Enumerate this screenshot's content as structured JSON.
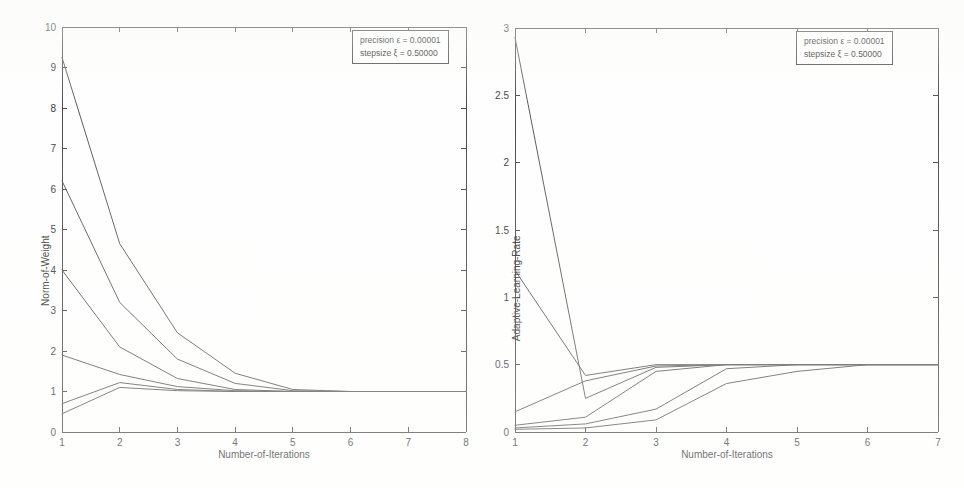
{
  "figure": {
    "background_color": "#fefefe",
    "line_color": "#5a5a5a",
    "axis_color": "#4b4b4b"
  },
  "panels": [
    {
      "id": "left",
      "legend": {
        "line1": "precision ε = 0.00001",
        "line2": "stepsize ξ = 0.50000"
      }
    },
    {
      "id": "right",
      "legend": {
        "line1": "precision ε = 0.00001",
        "line2": "stepsize ξ = 0.50000"
      }
    }
  ],
  "chart_data": [
    {
      "type": "line",
      "title": "",
      "xlabel": "Number-of-Iterations",
      "ylabel": "Norm-of-Weight",
      "xlim": [
        1,
        8
      ],
      "ylim": [
        0,
        10
      ],
      "xticks": [
        1,
        2,
        3,
        4,
        5,
        6,
        7,
        8
      ],
      "xticklabels": [
        "1",
        "2",
        "3",
        "4",
        "5",
        "6",
        "7",
        "8"
      ],
      "yticks": [
        0,
        1,
        2,
        3,
        4,
        5,
        6,
        7,
        8,
        9,
        10
      ],
      "yticklabels": [
        "0",
        "1",
        "2",
        "3",
        "4",
        "5",
        "6",
        "7",
        "8",
        "9",
        "10"
      ],
      "grid": false,
      "legend_position": "top-right",
      "legend_entries": [
        "precision ε = 0.00001",
        "stepsize ξ = 0.50000"
      ],
      "x": [
        1,
        2,
        3,
        4,
        5,
        6,
        7,
        8
      ],
      "series": [
        {
          "name": "run-1",
          "values": [
            9.25,
            4.65,
            2.45,
            1.45,
            1.05,
            1.0,
            1.0,
            1.0
          ]
        },
        {
          "name": "run-2",
          "values": [
            6.2,
            3.2,
            1.8,
            1.2,
            1.02,
            1.0,
            1.0,
            1.0
          ]
        },
        {
          "name": "run-3",
          "values": [
            4.0,
            2.1,
            1.32,
            1.05,
            1.0,
            1.0,
            1.0,
            1.0
          ]
        },
        {
          "name": "run-4",
          "values": [
            1.9,
            1.42,
            1.12,
            1.02,
            1.0,
            1.0,
            1.0,
            1.0
          ]
        },
        {
          "name": "run-5",
          "values": [
            0.7,
            1.22,
            1.05,
            1.0,
            1.0,
            1.0,
            1.0,
            1.0
          ]
        },
        {
          "name": "run-6",
          "values": [
            0.45,
            1.1,
            1.02,
            1.0,
            1.0,
            1.0,
            1.0,
            1.0
          ]
        }
      ]
    },
    {
      "type": "line",
      "title": "",
      "xlabel": "Number-of-Iterations",
      "ylabel": "Adaptive-Learning-Rate",
      "xlim": [
        1,
        7
      ],
      "ylim": [
        0,
        3
      ],
      "xticks": [
        1,
        2,
        3,
        4,
        5,
        6,
        7
      ],
      "xticklabels": [
        "1",
        "2",
        "3",
        "4",
        "5",
        "6",
        "7"
      ],
      "yticks": [
        0,
        0.5,
        1,
        1.5,
        2,
        2.5,
        3
      ],
      "yticklabels": [
        "0",
        "0.5",
        "1",
        "1.5",
        "2",
        "2.5",
        "3"
      ],
      "grid": false,
      "legend_position": "top-right",
      "legend_entries": [
        "precision ε = 0.00001",
        "stepsize ξ = 0.50000"
      ],
      "x": [
        1,
        2,
        3,
        4,
        5,
        6,
        7
      ],
      "series": [
        {
          "name": "run-1",
          "values": [
            2.93,
            0.25,
            0.48,
            0.5,
            0.5,
            0.5,
            0.5
          ]
        },
        {
          "name": "run-2",
          "values": [
            1.2,
            0.42,
            0.5,
            0.5,
            0.5,
            0.5,
            0.5
          ]
        },
        {
          "name": "run-3",
          "values": [
            0.15,
            0.38,
            0.49,
            0.5,
            0.5,
            0.5,
            0.5
          ]
        },
        {
          "name": "run-4",
          "values": [
            0.05,
            0.11,
            0.45,
            0.5,
            0.5,
            0.5,
            0.5
          ]
        },
        {
          "name": "run-5",
          "values": [
            0.03,
            0.06,
            0.17,
            0.47,
            0.5,
            0.5,
            0.5
          ]
        },
        {
          "name": "run-6",
          "values": [
            0.02,
            0.03,
            0.09,
            0.36,
            0.45,
            0.5,
            0.5
          ]
        }
      ]
    }
  ]
}
